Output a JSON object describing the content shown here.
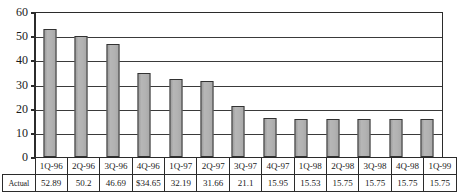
{
  "chart_data": {
    "type": "bar",
    "title": "",
    "xlabel": "",
    "ylabel": "",
    "ylim": [
      0,
      60
    ],
    "ytick_step": 10,
    "yticks": [
      60,
      50,
      40,
      30,
      20,
      10,
      0
    ],
    "grid": true,
    "legend": "none",
    "categories": [
      "1Q-96",
      "2Q-96",
      "3Q-96",
      "4Q-96",
      "1Q-97",
      "2Q-97",
      "3Q-97",
      "4Q-97",
      "1Q-98",
      "2Q-98",
      "3Q-98",
      "4Q-98",
      "1Q-99"
    ],
    "values": [
      52.89,
      50.2,
      46.69,
      34.65,
      32.19,
      31.66,
      21.1,
      15.95,
      15.53,
      15.75,
      15.75,
      15.75,
      15.75
    ],
    "value_labels": [
      "52.89",
      "50.2",
      "46.69",
      "$34.65",
      "32.19",
      "31.66",
      "21.1",
      "15.95",
      "15.53",
      "15.75",
      "15.75",
      "15.75",
      "15.75"
    ],
    "series": [
      {
        "name": "Actual",
        "values": [
          52.89,
          50.2,
          46.69,
          34.65,
          32.19,
          31.66,
          21.1,
          15.95,
          15.53,
          15.75,
          15.75,
          15.75,
          15.75
        ]
      }
    ],
    "bar_color": "#aeaeae",
    "bar_border_color": "#323232"
  },
  "table": {
    "row_header": "Actual",
    "corner_label": "",
    "columns": [
      "1Q-96",
      "2Q-96",
      "3Q-96",
      "4Q-96",
      "1Q-97",
      "2Q-97",
      "3Q-97",
      "4Q-97",
      "1Q-98",
      "2Q-98",
      "3Q-98",
      "4Q-98",
      "1Q-99"
    ],
    "values": [
      "52.89",
      "50.2",
      "46.69",
      "$34.65",
      "32.19",
      "31.66",
      "21.1",
      "15.95",
      "15.53",
      "15.75",
      "15.75",
      "15.75",
      "15.75"
    ]
  },
  "axis": {
    "y_labels": [
      "60",
      "50",
      "40",
      "30",
      "20",
      "10",
      "0"
    ]
  },
  "title_sliver": ""
}
